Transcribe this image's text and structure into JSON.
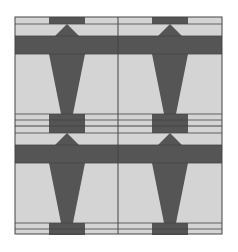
{
  "diagram": {
    "width": 238,
    "height": 252,
    "layout": "2x2 tile grid",
    "colors": {
      "background": "#ffffff",
      "light_fill": "#d4d4d4",
      "dark_fill": "#555555",
      "line": "#444444"
    },
    "grid": {
      "left": 15,
      "top": 17,
      "right": 222,
      "bottom": 234,
      "col_divider_x": 118,
      "row_divider_y": 126
    },
    "tiles": [
      {
        "name": "top-left",
        "cx": 67,
        "y0": 17
      },
      {
        "name": "top-right",
        "cx": 170,
        "y0": 17
      },
      {
        "name": "bottom-left",
        "cx": 67,
        "y0": 126
      },
      {
        "name": "bottom-right",
        "cx": 170,
        "y0": 126
      }
    ]
  }
}
